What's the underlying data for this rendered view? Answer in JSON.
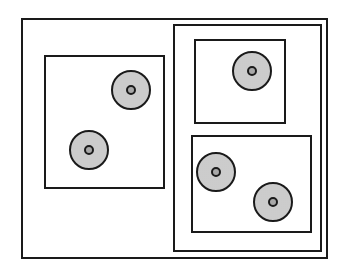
{
  "diagram": {
    "colors": {
      "stroke": "#1a1a1a",
      "disc_fill": "#d8d8d8",
      "core_fill": "#a8a8a8",
      "background": "#ffffff"
    },
    "regions": [
      {
        "id": "outer-frame",
        "label": "",
        "children": [
          "left-box",
          "right-container"
        ]
      },
      {
        "id": "left-box",
        "label": "",
        "cell_count": 2
      },
      {
        "id": "right-container",
        "label": "",
        "children": [
          "top-right-box",
          "bottom-right-box"
        ]
      },
      {
        "id": "top-right-box",
        "label": "",
        "cell_count": 1
      },
      {
        "id": "bottom-right-box",
        "label": "",
        "cell_count": 2
      }
    ],
    "total_cells": 5
  }
}
